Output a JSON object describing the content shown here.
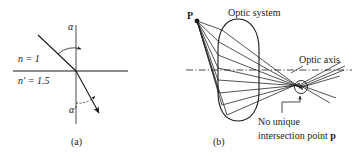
{
  "figure": {
    "panels": [
      {
        "id": "a",
        "caption": "(a)",
        "title": "Refraction at a plane interface",
        "labels": {
          "n_upper": "n = 1",
          "n_lower": "n′ = 1.5",
          "angle_incidence": "α",
          "angle_refraction": "α′"
        }
      },
      {
        "id": "b",
        "caption": "(b)",
        "title": "Spherical aberration in an optic system",
        "labels": {
          "source_point": "P",
          "optic_system": "Optic system",
          "optic_axis": "Optic axis",
          "no_unique_line1": "No unique",
          "no_unique_line2_prefix": "intersection point ",
          "no_unique_line2_point": "p"
        }
      }
    ],
    "colors": {
      "ink": "#1a1a1a",
      "background": "#ffffff"
    }
  }
}
